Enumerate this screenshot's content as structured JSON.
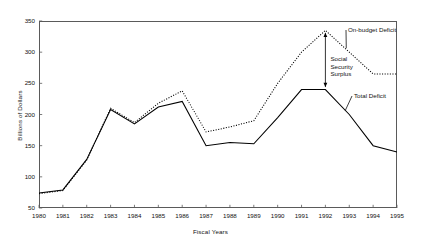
{
  "chart_data": {
    "type": "line",
    "title": "",
    "xlabel": "Fiscal Years",
    "ylabel": "Billions of Dollars",
    "x": [
      1980,
      1981,
      1982,
      1983,
      1984,
      1985,
      1986,
      1987,
      1988,
      1989,
      1990,
      1991,
      1992,
      1993,
      1994,
      1995
    ],
    "xtick_labels": [
      "1980",
      "1981",
      "1982",
      "1983",
      "1984",
      "1985",
      "1986",
      "1987",
      "1988",
      "1989",
      "1990",
      "1991",
      "1992",
      "1993",
      "1994",
      "1995"
    ],
    "ytick_labels": [
      "50",
      "100",
      "150",
      "200",
      "250",
      "300",
      "350"
    ],
    "yticks": [
      50,
      100,
      150,
      200,
      250,
      300,
      350
    ],
    "ylim": [
      50,
      350
    ],
    "xlim": [
      1980,
      1995
    ],
    "grid": false,
    "legend": "none (inline annotations)",
    "series": [
      {
        "name": "Total Deficit",
        "style": "solid",
        "color": "#000000",
        "values": [
          74,
          79,
          128,
          208,
          185,
          212,
          221,
          150,
          155,
          153,
          195,
          240,
          240,
          200,
          150,
          140
        ]
      },
      {
        "name": "On-budget Deficit",
        "style": "dotted",
        "color": "#000000",
        "values": [
          73,
          78,
          127,
          210,
          187,
          218,
          238,
          172,
          180,
          190,
          250,
          300,
          335,
          300,
          265,
          265
        ]
      }
    ],
    "annotations": [
      {
        "name": "on-budget-deficit-label",
        "text": "On-budget Deficit"
      },
      {
        "name": "social-security-surplus-label",
        "text": "Social Security Surplus"
      },
      {
        "name": "total-deficit-label",
        "text": "Total Deficit"
      }
    ]
  }
}
